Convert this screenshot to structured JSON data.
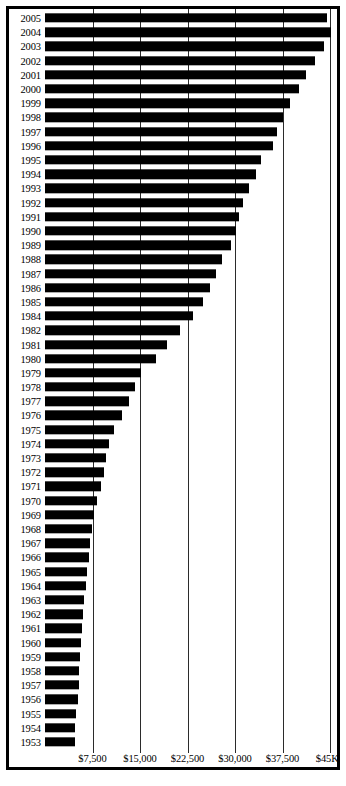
{
  "chart_data": {
    "type": "bar",
    "orientation": "horizontal",
    "title": "",
    "subtitle": "",
    "xlabel": "",
    "ylabel": "",
    "xlim": [
      0,
      45000
    ],
    "ylim": null,
    "grid": true,
    "legend": null,
    "legend_position": "none",
    "bar_color": "#000000",
    "background_color": "#ffffff",
    "axis_color": "#000000",
    "gridline_color": "#2b2b2b",
    "xticks": [
      7500,
      15000,
      22500,
      30000,
      37500,
      45000
    ],
    "xtick_labels": [
      "$7,500",
      "$15,000",
      "$22,500",
      "$30,000",
      "$37,500",
      "$45K"
    ],
    "categories": [
      "2005",
      "2004",
      "2003",
      "2002",
      "2001",
      "2000",
      "1999",
      "1998",
      "1997",
      "1996",
      "1995",
      "1994",
      "1993",
      "1992",
      "1991",
      "1990",
      "1989",
      "1988",
      "1987",
      "1986",
      "1985",
      "1984",
      "1982",
      "1981",
      "1980",
      "1979",
      "1978",
      "1977",
      "1976",
      "1975",
      "1974",
      "1973",
      "1972",
      "1971",
      "1970",
      "1969",
      "1968",
      "1967",
      "1966",
      "1965",
      "1964",
      "1963",
      "1962",
      "1961",
      "1960",
      "1959",
      "1958",
      "1957",
      "1956",
      "1955",
      "1954",
      "1953"
    ],
    "values": [
      44600,
      45100,
      44100,
      42600,
      41200,
      40100,
      38700,
      37600,
      36700,
      36000,
      34100,
      33300,
      32200,
      31300,
      30700,
      30100,
      29300,
      28000,
      27000,
      26000,
      24900,
      23400,
      21300,
      19300,
      17600,
      15100,
      14200,
      13300,
      12200,
      10900,
      10100,
      9700,
      9300,
      8900,
      8200,
      7700,
      7400,
      7100,
      6900,
      6600,
      6400,
      6200,
      6000,
      5900,
      5700,
      5600,
      5400,
      5300,
      5200,
      4900,
      4800,
      4700
    ]
  }
}
